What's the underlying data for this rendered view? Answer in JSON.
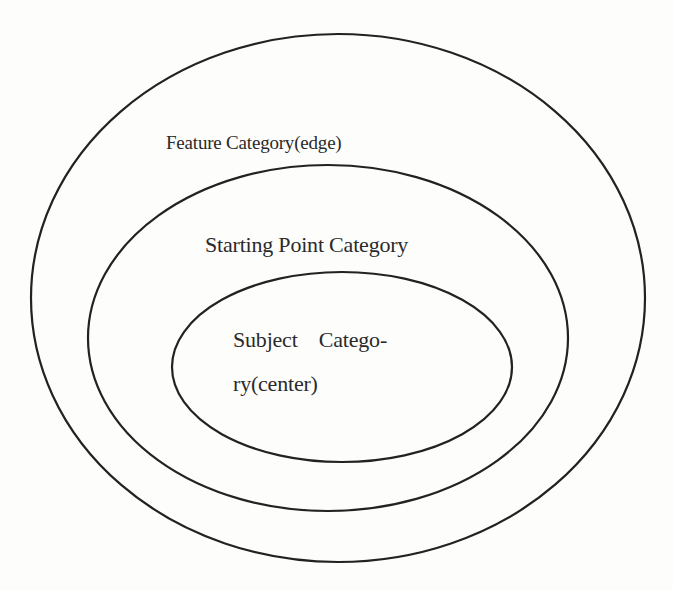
{
  "diagram": {
    "type": "nested-ellipses",
    "stroke_color": "#222222",
    "background": "#fdfdfc",
    "layers": [
      {
        "id": "outer",
        "label": "Feature Category(edge)",
        "ellipse": {
          "cx": 338,
          "cy": 298,
          "rx": 307,
          "ry": 264
        }
      },
      {
        "id": "middle",
        "label": "Starting Point Category",
        "ellipse": {
          "cx": 328,
          "cy": 338,
          "rx": 240,
          "ry": 173
        }
      },
      {
        "id": "inner",
        "label": "Subject Category(center)",
        "label_lines": [
          "Subject    Catego-",
          "ry(center)"
        ],
        "ellipse": {
          "cx": 342,
          "cy": 367,
          "rx": 170,
          "ry": 95
        }
      }
    ]
  }
}
